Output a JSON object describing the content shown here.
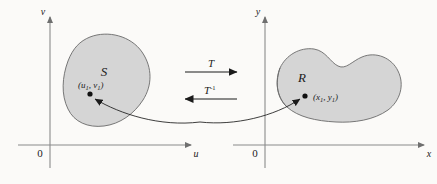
{
  "figure": {
    "caption_alt": "Change of variables: transformation T maps region S in the uv-plane onto region R in the xy-plane",
    "background_color": "#fbfaf8",
    "region_fill_color": "#d5d5d5",
    "region_stroke_color": "#6a6a6a",
    "axis_color": "#8a8a8a",
    "ink_color": "#1b1b1b"
  },
  "left_plane": {
    "vertical_axis_label": "v",
    "horizontal_axis_label": "u",
    "origin_label": "0",
    "region_label": "S",
    "point_label_open": "(",
    "point_var1": "u",
    "point_sub1": "1",
    "point_comma": ", ",
    "point_var2": "v",
    "point_sub2": "1",
    "point_label_close": ")",
    "point_label_full": "(u1, v1)"
  },
  "right_plane": {
    "vertical_axis_label": "y",
    "horizontal_axis_label": "x",
    "origin_label": "0",
    "region_label": "R",
    "point_label_open": "(",
    "point_var1": "x",
    "point_sub1": "1",
    "point_comma": ", ",
    "point_var2": "y",
    "point_sub2": "1",
    "point_label_close": ")",
    "point_label_full": "(x1, y1)"
  },
  "mapping": {
    "forward_label": "T",
    "inverse_base": "T",
    "inverse_exponent": "-1",
    "inverse_label_full": "T-1",
    "forward_direction": "right",
    "inverse_direction": "left"
  }
}
